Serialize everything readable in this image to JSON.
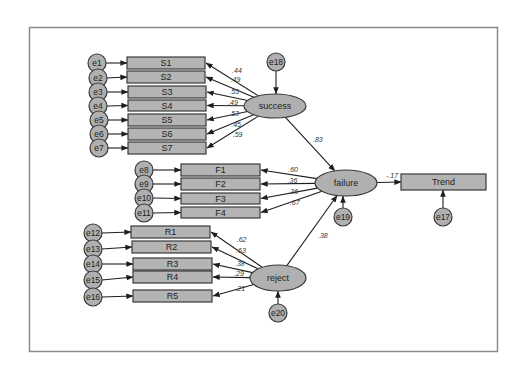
{
  "diagram": {
    "type": "structural-equation-model",
    "latent": [
      {
        "id": "success",
        "label": "success",
        "cx": 275,
        "cy": 106,
        "rx": 31,
        "ry": 12,
        "error": "e18"
      },
      {
        "id": "failure",
        "label": "failure",
        "cx": 346,
        "cy": 183,
        "rx": 31,
        "ry": 13,
        "error": "e19"
      },
      {
        "id": "reject",
        "label": "reject",
        "cx": 278,
        "cy": 278,
        "rx": 28,
        "ry": 13,
        "error": "e20"
      }
    ],
    "observed": [
      {
        "id": "S1",
        "label": "S1",
        "x": 127,
        "y": 57,
        "w": 78,
        "h": 12,
        "error": "e1",
        "from": "success",
        "coef": ".44"
      },
      {
        "id": "S2",
        "label": "S2",
        "x": 127,
        "y": 71,
        "w": 78,
        "h": 12,
        "error": "e2",
        "from": "success",
        "coef": ".49"
      },
      {
        "id": "S3",
        "label": "S3",
        "x": 128,
        "y": 86,
        "w": 78,
        "h": 12,
        "error": "e3",
        "from": "success",
        "coef": ".55"
      },
      {
        "id": "S4",
        "label": "S4",
        "x": 128,
        "y": 100,
        "w": 78,
        "h": 11,
        "error": "e4",
        "from": "success",
        "coef": ".49"
      },
      {
        "id": "S5",
        "label": "S5",
        "x": 128,
        "y": 114,
        "w": 78,
        "h": 12,
        "error": "e5",
        "from": "success",
        "coef": ".53"
      },
      {
        "id": "S6",
        "label": "S6",
        "x": 128,
        "y": 128,
        "w": 78,
        "h": 12,
        "error": "e6",
        "from": "success",
        "coef": ".45"
      },
      {
        "id": "S7",
        "label": "S7",
        "x": 128,
        "y": 142,
        "w": 78,
        "h": 12,
        "error": "e7",
        "from": "success",
        "coef": ".59"
      },
      {
        "id": "F1",
        "label": "F1",
        "x": 181,
        "y": 164,
        "w": 79,
        "h": 12,
        "error": "e8",
        "from": "failure",
        "coef": ".60"
      },
      {
        "id": "F2",
        "label": "F2",
        "x": 181,
        "y": 178,
        "w": 79,
        "h": 12,
        "error": "e9",
        "from": "failure",
        "coef": ".36"
      },
      {
        "id": "F3",
        "label": "F3",
        "x": 181,
        "y": 193,
        "w": 79,
        "h": 11,
        "error": "e10",
        "from": "failure",
        "coef": ".36"
      },
      {
        "id": "F4",
        "label": "F4",
        "x": 181,
        "y": 207,
        "w": 79,
        "h": 11,
        "error": "e11",
        "from": "failure",
        "coef": ".67"
      },
      {
        "id": "R1",
        "label": "R1",
        "x": 131,
        "y": 226,
        "w": 79,
        "h": 12,
        "error": "e12",
        "from": "reject",
        "coef": ".62"
      },
      {
        "id": "R2",
        "label": "R2",
        "x": 132,
        "y": 241,
        "w": 79,
        "h": 12,
        "error": "e13",
        "from": "reject",
        "coef": ".63"
      },
      {
        "id": "R3",
        "label": "R3",
        "x": 133,
        "y": 258,
        "w": 79,
        "h": 12,
        "error": "e14",
        "from": "reject",
        "coef": ".38"
      },
      {
        "id": "R4",
        "label": "R4",
        "x": 133,
        "y": 271,
        "w": 79,
        "h": 12,
        "error": "e15",
        "from": "reject",
        "coef": ".29"
      },
      {
        "id": "R5",
        "label": "R5",
        "x": 133,
        "y": 290,
        "w": 79,
        "h": 12,
        "error": "e16",
        "from": "reject",
        "coef": ".21"
      },
      {
        "id": "Trend",
        "label": "Trend",
        "x": 401,
        "y": 174,
        "w": 85,
        "h": 16,
        "error": "e17",
        "from": "failure",
        "coef": "-.17"
      }
    ],
    "errors": [
      {
        "id": "e1",
        "label": "e1",
        "cx": 97,
        "cy": 63
      },
      {
        "id": "e2",
        "label": "e2",
        "cx": 98,
        "cy": 78
      },
      {
        "id": "e3",
        "label": "e3",
        "cx": 98,
        "cy": 92
      },
      {
        "id": "e4",
        "label": "e4",
        "cx": 98,
        "cy": 106
      },
      {
        "id": "e5",
        "label": "e5",
        "cx": 99,
        "cy": 120
      },
      {
        "id": "e6",
        "label": "e6",
        "cx": 99,
        "cy": 134
      },
      {
        "id": "e7",
        "label": "e7",
        "cx": 99,
        "cy": 148
      },
      {
        "id": "e8",
        "label": "e8",
        "cx": 144,
        "cy": 170
      },
      {
        "id": "e9",
        "label": "e9",
        "cx": 144,
        "cy": 184
      },
      {
        "id": "e10",
        "label": "e10",
        "cx": 144,
        "cy": 198
      },
      {
        "id": "e11",
        "label": "e11",
        "cx": 144,
        "cy": 213
      },
      {
        "id": "e12",
        "label": "e12",
        "cx": 93,
        "cy": 233
      },
      {
        "id": "e13",
        "label": "e13",
        "cx": 93,
        "cy": 249
      },
      {
        "id": "e14",
        "label": "e14",
        "cx": 93,
        "cy": 264
      },
      {
        "id": "e15",
        "label": "e15",
        "cx": 93,
        "cy": 280
      },
      {
        "id": "e16",
        "label": "e16",
        "cx": 93,
        "cy": 297
      },
      {
        "id": "e17",
        "label": "e17",
        "cx": 443,
        "cy": 217
      },
      {
        "id": "e18",
        "label": "e18",
        "cx": 276,
        "cy": 62
      },
      {
        "id": "e19",
        "label": "e19",
        "cx": 343,
        "cy": 217
      },
      {
        "id": "e20",
        "label": "e20",
        "cx": 278,
        "cy": 313
      }
    ],
    "structural_paths": [
      {
        "from": "success",
        "to": "failure",
        "coef": ".83",
        "label_x": 313,
        "label_y": 142
      },
      {
        "from": "reject",
        "to": "failure",
        "coef": ".38",
        "label_x": 318,
        "label_y": 238
      },
      {
        "from": "failure",
        "to": "Trend",
        "coef": "-.17",
        "label_x": 386,
        "label_y": 178
      }
    ],
    "colors": {
      "node_fill": "#b0b0b0",
      "node_stroke": "#3a3a3a",
      "edge": "#1e1e1e",
      "frame": "#8a8a8a"
    }
  }
}
